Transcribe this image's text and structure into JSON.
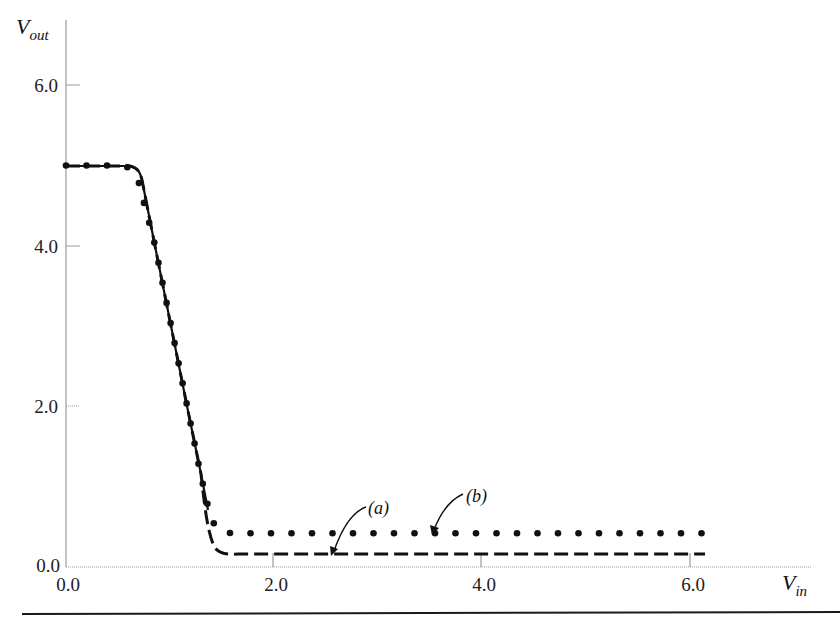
{
  "chart_data": {
    "type": "line",
    "title": "",
    "xlabel": "V_in",
    "ylabel": "V_out",
    "xlabel_main": "V",
    "xlabel_sub": "in",
    "ylabel_main": "V",
    "ylabel_sub": "out",
    "xlim": [
      0.0,
      7.2
    ],
    "ylim": [
      0.0,
      6.8
    ],
    "x_ticks": [
      0.0,
      2.0,
      4.0,
      6.0
    ],
    "x_tick_labels": [
      "0.0",
      "2.0",
      "4.0",
      "6.0"
    ],
    "y_ticks": [
      0.0,
      2.0,
      4.0,
      6.0
    ],
    "y_tick_labels": [
      "0.0",
      "2.0",
      "4.0",
      "6.0"
    ],
    "grid": false,
    "legend": "none (inline annotations)",
    "series": [
      {
        "name": "(a)",
        "style": "dashed",
        "x": [
          0.0,
          0.25,
          0.5,
          0.62,
          0.7,
          0.86,
          1.0,
          1.17,
          1.3,
          1.38,
          1.44,
          1.5,
          1.6,
          1.8,
          2.0,
          3.0,
          4.0,
          5.0,
          6.17
        ],
        "y": [
          5.0,
          5.0,
          5.0,
          4.97,
          4.8,
          4.0,
          3.1,
          2.0,
          1.15,
          0.6,
          0.3,
          0.2,
          0.16,
          0.16,
          0.16,
          0.16,
          0.16,
          0.16,
          0.16
        ]
      },
      {
        "name": "(b)",
        "style": "dotted",
        "x": [
          0.0,
          0.25,
          0.5,
          0.62,
          0.7,
          0.86,
          1.0,
          1.17,
          1.3,
          1.38,
          1.44,
          1.5,
          1.6,
          1.8,
          2.0,
          3.0,
          4.0,
          5.0,
          6.17
        ],
        "y": [
          5.0,
          5.0,
          5.0,
          4.97,
          4.8,
          4.0,
          3.1,
          2.0,
          1.15,
          0.7,
          0.5,
          0.44,
          0.42,
          0.42,
          0.42,
          0.42,
          0.42,
          0.42,
          0.42
        ]
      }
    ],
    "annotations": [
      {
        "text": "(a)",
        "label_at": [
          2.98,
          0.74
        ],
        "arrow_to": [
          2.56,
          0.16
        ]
      },
      {
        "text": "(b)",
        "label_at": [
          3.96,
          0.88
        ],
        "arrow_to": [
          3.54,
          0.4
        ]
      }
    ]
  },
  "labels": {
    "y_axis_main": "V",
    "y_axis_sub": "out",
    "x_axis_main": "V",
    "x_axis_sub": "in",
    "annotation_a": "(a)",
    "annotation_b": "(b)",
    "y_ticks": [
      "0.0",
      "2.0",
      "4.0",
      "6.0"
    ],
    "x_ticks": [
      "0.0",
      "2.0",
      "4.0",
      "6.0"
    ]
  },
  "colors": {
    "curve": "#111111",
    "axis": "#9a9a9a",
    "rule": "#1a1a1a"
  }
}
